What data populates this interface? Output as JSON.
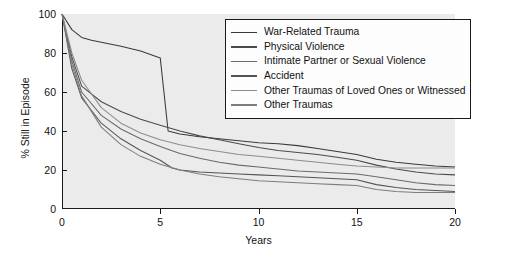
{
  "chart_data": {
    "type": "line",
    "title": "",
    "xlabel": "Years",
    "ylabel": "% Still in Episode",
    "xlim": [
      0,
      20
    ],
    "ylim": [
      0,
      100
    ],
    "xticks": [
      0,
      5,
      10,
      15,
      20
    ],
    "yticks": [
      0,
      20,
      40,
      60,
      80,
      100
    ],
    "grid": false,
    "legend_position": "top-right",
    "series": [
      {
        "name": "War-Related Trauma",
        "color": "#3a3a3a",
        "x": [
          0,
          0.5,
          1,
          1.5,
          2,
          3,
          4,
          5,
          5.4,
          6,
          7,
          8,
          9,
          10,
          11,
          12,
          13,
          14,
          15,
          16,
          17,
          18,
          19,
          20
        ],
        "values": [
          100,
          92,
          88,
          86.5,
          85.5,
          83.5,
          81,
          77.5,
          40,
          38.5,
          37,
          36,
          35,
          34,
          33.5,
          32.5,
          31,
          29.5,
          28,
          25.5,
          24,
          23,
          22,
          21.5
        ]
      },
      {
        "name": "Physical Violence",
        "color": "#4a4a4a",
        "x": [
          0,
          0.5,
          1,
          2,
          3,
          4,
          5,
          6,
          7,
          8,
          9,
          10,
          11,
          12,
          13,
          14,
          15,
          16,
          17,
          18,
          19,
          20
        ],
        "values": [
          100,
          78,
          63,
          55,
          50,
          46,
          43,
          40,
          37.5,
          35.5,
          33.5,
          31.5,
          30,
          29,
          28,
          26.5,
          25,
          22.5,
          20.5,
          19,
          18,
          17.5
        ]
      },
      {
        "name": "Intimate Partner or Sexual Violence",
        "color": "#6a6a6a",
        "x": [
          0,
          0.5,
          1,
          2,
          3,
          4,
          5,
          6,
          7,
          8,
          9,
          10,
          11,
          12,
          13,
          14,
          15,
          16,
          17,
          18,
          19,
          20
        ],
        "values": [
          100,
          76,
          60,
          48,
          41,
          36,
          32,
          28.5,
          26,
          24,
          22.5,
          21.5,
          20.5,
          19.5,
          19,
          18.5,
          18,
          16.5,
          15,
          13.5,
          12.5,
          12
        ]
      },
      {
        "name": "Accident",
        "color": "#555555",
        "x": [
          0,
          0.5,
          1,
          2,
          3,
          4,
          5,
          5.6,
          6,
          7,
          8,
          9,
          10,
          11,
          12,
          13,
          14,
          15,
          16,
          17,
          18,
          19,
          20
        ],
        "values": [
          100,
          72,
          57,
          44,
          36,
          30,
          25,
          21,
          20,
          19,
          18.5,
          18,
          17.5,
          17,
          16.5,
          16,
          15.5,
          15,
          12.5,
          11,
          10,
          9.5,
          9
        ]
      },
      {
        "name": "Other Traumas of Loved Ones or Witnessed",
        "color": "#8c8c8c",
        "x": [
          0,
          0.5,
          1,
          2,
          3,
          4,
          5,
          6,
          7,
          8,
          9,
          10,
          11,
          12,
          13,
          14,
          15,
          16,
          17,
          18,
          19,
          20
        ],
        "values": [
          100,
          80,
          66,
          52,
          44,
          39,
          35.5,
          33,
          31,
          29.5,
          28,
          27,
          26,
          25,
          24,
          23,
          22,
          21.5,
          21,
          21,
          21,
          21
        ]
      },
      {
        "name": "Other Traumas",
        "color": "#7d7d7d",
        "x": [
          0,
          0.5,
          1,
          2,
          3,
          4,
          5,
          6,
          7,
          8,
          9,
          10,
          11,
          12,
          13,
          14,
          15,
          16,
          17,
          18,
          19,
          20
        ],
        "values": [
          100,
          74,
          58,
          42,
          33,
          27,
          23,
          20,
          18,
          16.5,
          15.5,
          14.5,
          14,
          13.5,
          13,
          12.5,
          12,
          10,
          9,
          8.5,
          8.5,
          8.5
        ]
      }
    ]
  },
  "axes": {
    "ylabel": "% Still in Episode",
    "xlabel": "Years",
    "yticks": [
      "0",
      "20",
      "40",
      "60",
      "80",
      "100"
    ],
    "xticks": [
      "0",
      "5",
      "10",
      "15",
      "20"
    ]
  },
  "legend": {
    "entries": [
      {
        "label": "War-Related Trauma"
      },
      {
        "label": "Physical Violence"
      },
      {
        "label": "Intimate Partner or Sexual Violence"
      },
      {
        "label": "Accident"
      },
      {
        "label": "Other Traumas of Loved Ones or Witnessed"
      },
      {
        "label": "Other Traumas"
      }
    ]
  }
}
